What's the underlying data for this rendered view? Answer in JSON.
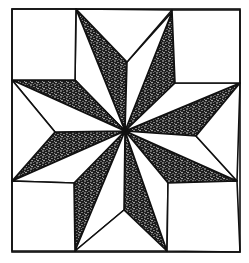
{
  "figure": {
    "width": 249,
    "height": 263,
    "colors": {
      "background": "#ffffff",
      "stroke": "#111111",
      "stipple_dark": "#1a1a1a",
      "stipple_light": "#ffffff"
    },
    "stroke_width": 1.6,
    "border": {
      "x1": 12,
      "y1": 9,
      "x2": 240,
      "y2": 252
    },
    "center": [
      125,
      131
    ],
    "corner_squares": [
      {
        "name": "corner-square-top-left",
        "points": [
          [
            12,
            9
          ],
          [
            76,
            9
          ],
          [
            75,
            80
          ],
          [
            12,
            80
          ]
        ]
      },
      {
        "name": "corner-square-top-right",
        "points": [
          [
            172,
            10
          ],
          [
            240,
            10
          ],
          [
            240,
            83
          ],
          [
            175,
            83
          ]
        ]
      },
      {
        "name": "corner-square-bottom-left",
        "points": [
          [
            12,
            181
          ],
          [
            74,
            183
          ],
          [
            75,
            251
          ],
          [
            12,
            251
          ]
        ]
      },
      {
        "name": "corner-square-bottom-right",
        "points": [
          [
            168,
            183
          ],
          [
            237,
            181
          ],
          [
            240,
            252
          ],
          [
            167,
            251
          ]
        ]
      }
    ],
    "edge_triangles": [
      {
        "name": "edge-triangle-top",
        "points": [
          [
            76,
            9
          ],
          [
            172,
            10
          ],
          [
            127,
            62
          ]
        ]
      },
      {
        "name": "edge-triangle-right",
        "points": [
          [
            240,
            83
          ],
          [
            237,
            181
          ],
          [
            196,
            136
          ]
        ]
      },
      {
        "name": "edge-triangle-bottom",
        "points": [
          [
            75,
            251
          ],
          [
            167,
            251
          ],
          [
            124,
            210
          ]
        ]
      },
      {
        "name": "edge-triangle-left",
        "points": [
          [
            12,
            80
          ],
          [
            12,
            181
          ],
          [
            55,
            132
          ]
        ]
      }
    ],
    "diamonds": [
      {
        "name": "diamond-up-left",
        "tip": [
          76,
          9
        ],
        "dark_side": [
          127,
          62
        ],
        "light_side": [
          75,
          80
        ]
      },
      {
        "name": "diamond-up-right",
        "tip": [
          172,
          12
        ],
        "dark_side": [
          175,
          83
        ],
        "light_side": [
          127,
          62
        ]
      },
      {
        "name": "diamond-right-up",
        "tip": [
          240,
          83
        ],
        "dark_side": [
          196,
          136
        ],
        "light_side": [
          175,
          83
        ]
      },
      {
        "name": "diamond-right-down",
        "tip": [
          237,
          181
        ],
        "dark_side": [
          168,
          183
        ],
        "light_side": [
          196,
          136
        ]
      },
      {
        "name": "diamond-down-right",
        "tip": [
          167,
          251
        ],
        "dark_side": [
          124,
          210
        ],
        "light_side": [
          168,
          183
        ]
      },
      {
        "name": "diamond-down-left",
        "tip": [
          75,
          251
        ],
        "dark_side": [
          74,
          183
        ],
        "light_side": [
          124,
          210
        ]
      },
      {
        "name": "diamond-left-down",
        "tip": [
          12,
          181
        ],
        "dark_side": [
          55,
          132
        ],
        "light_side": [
          74,
          183
        ]
      },
      {
        "name": "diamond-left-up",
        "tip": [
          12,
          80
        ],
        "dark_side": [
          75,
          80
        ],
        "light_side": [
          55,
          132
        ]
      }
    ]
  }
}
